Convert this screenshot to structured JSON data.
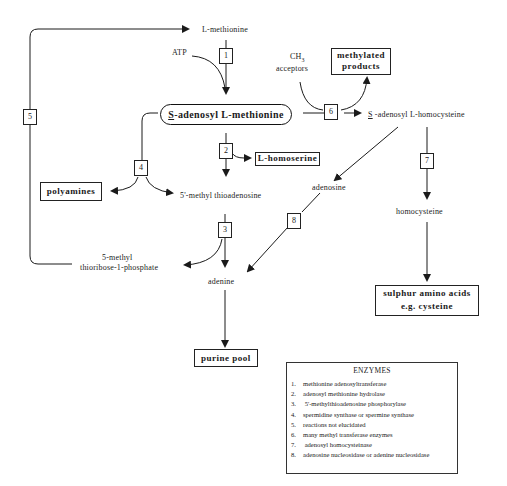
{
  "diagram": {
    "nodes": {
      "l_methionine": "L-methionine",
      "atp": "ATP",
      "ch3": "CH",
      "ch3_sub": "3",
      "acceptors": "acceptors",
      "methylated_products_1": "methylated",
      "methylated_products_2": "products",
      "sam_prefix": "S",
      "sam_rest": "-adenosyl L-methionine",
      "sah_prefix": "S",
      "sah_rest": " -adenosyl  L-homocysteine",
      "l_homoserine": "L-homoserine",
      "polyamines": "polyamines",
      "mta": "5'-methyl  thioadenosine",
      "adenosine": "adenosine",
      "homocysteine": "homocysteine",
      "mtr_1": "5-methyl",
      "mtr_2": "thioribose-1-phosphate",
      "adenine": "adenine",
      "purine_pool": "purine pool",
      "sulphur_1": "sulphur amino acids",
      "sulphur_2": "e.g. cysteine"
    },
    "enzyme_steps": [
      "1",
      "2",
      "3",
      "4",
      "5",
      "6",
      "7",
      "8"
    ],
    "legend": {
      "title": "ENZYMES",
      "items": [
        {
          "n": "1.",
          "text": "methionine adenosyltransferase"
        },
        {
          "n": "2.",
          "text": "adenosyl methionine hydrolase"
        },
        {
          "n": "3.",
          "text": " 5'-methylthioadenosine  phosphorylase"
        },
        {
          "n": "4.",
          "text": "spermidine synthase or spermine synthase"
        },
        {
          "n": "5.",
          "text": "reactions not elucidated"
        },
        {
          "n": "6.",
          "text": "many methyl transferase enzymes"
        },
        {
          "n": "7.",
          "text": " adenosyl homocysteinase"
        },
        {
          "n": "8.",
          "text": "adenosine nucleosidase or adenine nucleosidase"
        }
      ]
    },
    "colors": {
      "line": "#1a1a1a",
      "background": "#ffffff"
    }
  }
}
